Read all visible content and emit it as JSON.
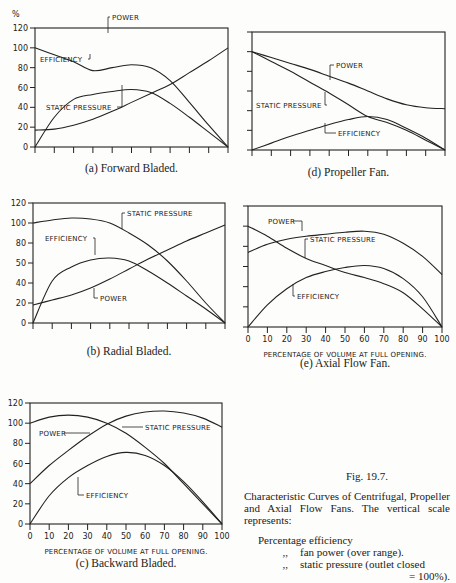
{
  "figure": {
    "number": "Fig. 19.7.",
    "description": "Characteristic Curves of Centrifugal, Propeller and Axial Flow Fans. The vertical scale represents:",
    "legend_lines": [
      "Percentage efficiency",
      "fan power (over range).",
      "static pressure (outlet closed",
      "= 100%)."
    ],
    "ditto": ",,",
    "y_unit": "%",
    "x_axis_title": "PERCENTAGE OF VOLUME AT FULL OPENING."
  },
  "chart_data": [
    {
      "id": "a",
      "type": "line",
      "title": "(a) Forward Bladed.",
      "xlabel": "",
      "ylabel": "%",
      "xlim": [
        0,
        100
      ],
      "ylim": [
        0,
        120
      ],
      "yticks": [
        "0",
        "20",
        "40",
        "60",
        "80",
        "100",
        "120"
      ],
      "x": [
        0,
        10,
        20,
        30,
        40,
        50,
        60,
        70,
        80,
        90,
        100
      ],
      "series": [
        {
          "name": "STATIC PRESSURE",
          "values": [
            100,
            93,
            86,
            77,
            80,
            83,
            80,
            67,
            45,
            22,
            0
          ]
        },
        {
          "name": "EFFICIENCY",
          "values": [
            0,
            30,
            48,
            53,
            56,
            58,
            55,
            44,
            30,
            15,
            0
          ]
        },
        {
          "name": "POWER",
          "values": [
            17,
            18,
            22,
            28,
            36,
            45,
            54,
            63,
            75,
            87,
            100
          ]
        }
      ]
    },
    {
      "id": "b",
      "type": "line",
      "title": "(b) Radial Bladed.",
      "xlabel": "",
      "ylabel": "%",
      "xlim": [
        0,
        100
      ],
      "ylim": [
        0,
        120
      ],
      "yticks": [
        "0",
        "20",
        "40",
        "50",
        "80",
        "100",
        "120"
      ],
      "x": [
        0,
        10,
        20,
        30,
        40,
        50,
        60,
        70,
        80,
        90,
        100
      ],
      "series": [
        {
          "name": "STATIC PRESSURE",
          "values": [
            100,
            103,
            105,
            104,
            100,
            90,
            78,
            62,
            42,
            20,
            0
          ]
        },
        {
          "name": "EFFICIENCY",
          "values": [
            0,
            42,
            56,
            63,
            65,
            62,
            52,
            40,
            27,
            14,
            0
          ]
        },
        {
          "name": "POWER",
          "values": [
            18,
            23,
            28,
            35,
            44,
            54,
            64,
            73,
            82,
            90,
            98
          ]
        }
      ]
    },
    {
      "id": "c",
      "type": "line",
      "title": "(c) Backward Bladed.",
      "xlabel": "PERCENTAGE OF VOLUME AT FULL OPENING.",
      "ylabel": "%",
      "xlim": [
        0,
        100
      ],
      "ylim": [
        0,
        120
      ],
      "xticks": [
        "0",
        "10",
        "20",
        "30",
        "40",
        "50",
        "60",
        "70",
        "80",
        "90",
        "100"
      ],
      "yticks": [
        "0",
        "20",
        "40",
        "60",
        "80",
        "100",
        "120"
      ],
      "x": [
        0,
        10,
        20,
        30,
        40,
        50,
        60,
        70,
        80,
        90,
        100
      ],
      "series": [
        {
          "name": "STATIC PRESSURE",
          "values": [
            100,
            106,
            108,
            106,
            100,
            90,
            76,
            60,
            40,
            20,
            0
          ]
        },
        {
          "name": "POWER",
          "values": [
            40,
            58,
            73,
            87,
            99,
            107,
            111,
            112,
            110,
            105,
            96
          ]
        },
        {
          "name": "EFFICIENCY",
          "values": [
            0,
            28,
            46,
            58,
            67,
            71,
            68,
            58,
            42,
            22,
            0
          ]
        }
      ]
    },
    {
      "id": "d",
      "type": "line",
      "title": "(d) Propeller Fan.",
      "xlabel": "",
      "ylabel": "%",
      "xlim": [
        0,
        100
      ],
      "ylim": [
        0,
        120
      ],
      "x": [
        0,
        10,
        20,
        30,
        40,
        50,
        60,
        70,
        80,
        90,
        100
      ],
      "series": [
        {
          "name": "POWER",
          "values": [
            100,
            94,
            88,
            82,
            75,
            68,
            60,
            52,
            46,
            43,
            42
          ]
        },
        {
          "name": "STATIC PRESSURE",
          "values": [
            100,
            90,
            80,
            69,
            58,
            46,
            34,
            28,
            20,
            10,
            0
          ]
        },
        {
          "name": "EFFICIENCY",
          "values": [
            0,
            7,
            14,
            20,
            26,
            31,
            34,
            31,
            22,
            12,
            0
          ]
        }
      ]
    },
    {
      "id": "e",
      "type": "line",
      "title": "(e) Axial Flow Fan.",
      "xlabel": "PERCENTAGE OF VOLUME AT FULL OPENING.",
      "ylabel": "%",
      "xlim": [
        0,
        100
      ],
      "ylim": [
        0,
        120
      ],
      "xticks": [
        "0",
        "10",
        "20",
        "30",
        "40",
        "50",
        "60",
        "70",
        "80",
        "90",
        "100"
      ],
      "x": [
        0,
        10,
        20,
        30,
        40,
        50,
        60,
        70,
        80,
        90,
        100
      ],
      "series": [
        {
          "name": "POWER",
          "values": [
            74,
            82,
            87,
            90,
            92,
            94,
            95,
            92,
            83,
            70,
            52
          ]
        },
        {
          "name": "STATIC PRESSURE",
          "values": [
            100,
            90,
            78,
            68,
            61,
            54,
            49,
            43,
            34,
            18,
            0
          ]
        },
        {
          "name": "EFFICIENCY",
          "values": [
            0,
            22,
            38,
            49,
            55,
            59,
            61,
            58,
            48,
            30,
            0
          ]
        }
      ]
    }
  ]
}
